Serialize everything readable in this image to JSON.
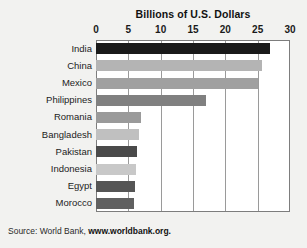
{
  "chart_data": {
    "type": "bar",
    "orientation": "horizontal",
    "title": "Billions of U.S. Dollars",
    "xlabel": "",
    "ylabel": "",
    "xlim": [
      0,
      30
    ],
    "xticks": [
      0,
      5,
      10,
      15,
      20,
      25,
      30
    ],
    "grid": true,
    "legend": null,
    "categories": [
      "India",
      "China",
      "Mexico",
      "Philippines",
      "Romania",
      "Bangladesh",
      "Pakistan",
      "Indonesia",
      "Egypt",
      "Morocco"
    ],
    "values": [
      26.9,
      25.7,
      25.0,
      17.0,
      7.0,
      6.6,
      6.4,
      6.2,
      6.1,
      5.9
    ],
    "bar_colors": [
      "#1a1a1a",
      "#b4b4b4",
      "#a0a0a0",
      "#808080",
      "#9a9a9a",
      "#c0c0c0",
      "#4a4a4a",
      "#c8c8c8",
      "#555555",
      "#606060"
    ],
    "points": [
      {
        "category": "India",
        "value": 26.9,
        "color": "#1a1a1a"
      },
      {
        "category": "China",
        "value": 25.7,
        "color": "#b4b4b4"
      },
      {
        "category": "Mexico",
        "value": 25.0,
        "color": "#a0a0a0"
      },
      {
        "category": "Philippines",
        "value": 17.0,
        "color": "#808080"
      },
      {
        "category": "Romania",
        "value": 7.0,
        "color": "#9a9a9a"
      },
      {
        "category": "Bangladesh",
        "value": 6.6,
        "color": "#c0c0c0"
      },
      {
        "category": "Pakistan",
        "value": 6.4,
        "color": "#4a4a4a"
      },
      {
        "category": "Indonesia",
        "value": 6.2,
        "color": "#c8c8c8"
      },
      {
        "category": "Egypt",
        "value": 6.1,
        "color": "#555555"
      },
      {
        "category": "Morocco",
        "value": 5.9,
        "color": "#606060"
      }
    ]
  },
  "source": {
    "prefix": "Source: World Bank, ",
    "url": "www.worldbank.org."
  },
  "colors": {
    "background": "#f2f2f0",
    "plot_background": "#ffffff",
    "frame": "#7d7d7d",
    "gridline": "#9a9a9a",
    "text": "#1a1a1a"
  }
}
